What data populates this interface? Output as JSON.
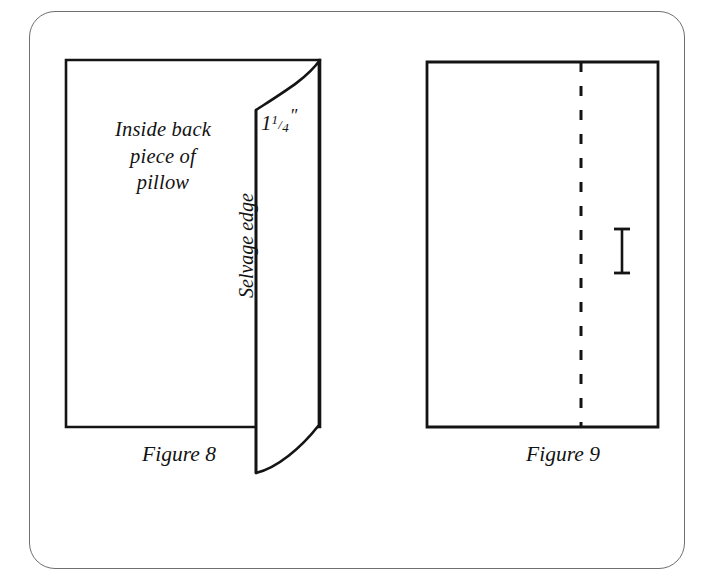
{
  "plate": {
    "background_color": "#ffffff",
    "ink_color": "#131313",
    "frame": {
      "name": "rounded-border",
      "color": "#6f6f6f",
      "corner_radius_px": 26
    }
  },
  "figures": [
    {
      "id": "figure-8",
      "caption": "Figure 8",
      "labels": {
        "inside_piece": {
          "lines": [
            "Inside back",
            "piece of",
            "pillow"
          ],
          "full_text": "Inside back piece of pillow"
        },
        "dimension": {
          "whole": "1",
          "numerator": "1",
          "slash": "/",
          "denominator": "4",
          "unit": "″",
          "full_text": "1 1/4\""
        },
        "selvage": "Selvage edge"
      },
      "shapes": [
        {
          "name": "back-piece-rectangle",
          "type": "rectangle"
        },
        {
          "name": "folded-selvage-flap",
          "type": "curved-flap"
        }
      ]
    },
    {
      "id": "figure-9",
      "caption": "Figure 9",
      "labels": {},
      "shapes": [
        {
          "name": "pillow-back-rectangle",
          "type": "rectangle"
        },
        {
          "name": "stitch-line",
          "type": "dashed-vertical-line"
        },
        {
          "name": "measurement-marker",
          "type": "i-beam"
        }
      ]
    }
  ]
}
